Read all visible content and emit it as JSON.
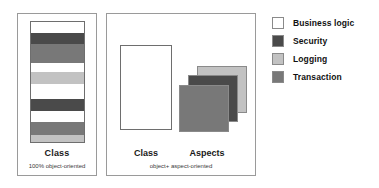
{
  "diagram": {
    "title_hidden": "",
    "colors": {
      "business_logic": "#ffffff",
      "security": "#4a4a4a",
      "logging": "#c2c2c2",
      "transaction": "#787878",
      "panel_border": "#9a9a9a",
      "shape_border": "#6e6e6e",
      "text": "#111111"
    }
  },
  "panel_oo": {
    "class_label": "Class",
    "caption": "100% object-oriented",
    "class_bar_stripes": [
      {
        "concern": "Business logic",
        "color": "#ffffff",
        "height_pct": 9
      },
      {
        "concern": "Security",
        "color": "#4a4a4a",
        "height_pct": 9
      },
      {
        "concern": "Transaction",
        "color": "#787878",
        "height_pct": 16
      },
      {
        "concern": "Business logic",
        "color": "#ffffff",
        "height_pct": 8
      },
      {
        "concern": "Logging",
        "color": "#c2c2c2",
        "height_pct": 10
      },
      {
        "concern": "Business logic",
        "color": "#ffffff",
        "height_pct": 12
      },
      {
        "concern": "Security",
        "color": "#4a4a4a",
        "height_pct": 10
      },
      {
        "concern": "Business logic",
        "color": "#ffffff",
        "height_pct": 9
      },
      {
        "concern": "Transaction",
        "color": "#787878",
        "height_pct": 11
      },
      {
        "concern": "Logging",
        "color": "#c2c2c2",
        "height_pct": 6
      }
    ]
  },
  "panel_aop": {
    "class_label": "Class",
    "aspects_label": "Aspects",
    "caption": "object+ aspect-oriented",
    "class_box": {
      "concern": "Business logic",
      "color": "#ffffff"
    },
    "aspect_cards": [
      {
        "concern": "Logging",
        "color": "#c2c2c2",
        "position": "back"
      },
      {
        "concern": "Security",
        "color": "#4a4a4a",
        "position": "middle"
      },
      {
        "concern": "Transaction",
        "color": "#787878",
        "position": "front"
      }
    ]
  },
  "legend": {
    "items": [
      {
        "label": "Business logic",
        "color": "#ffffff"
      },
      {
        "label": "Security",
        "color": "#4a4a4a"
      },
      {
        "label": "Logging",
        "color": "#c2c2c2"
      },
      {
        "label": "Transaction",
        "color": "#787878"
      }
    ]
  }
}
